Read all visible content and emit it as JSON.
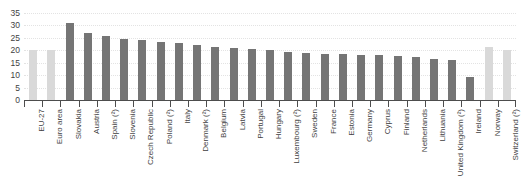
{
  "chart_data": {
    "type": "bar",
    "title": "",
    "xlabel": "",
    "ylabel": "",
    "ylim": [
      0,
      35
    ],
    "ytick_step": 5,
    "yticks": [
      "0",
      "5",
      "10",
      "15",
      "20",
      "25",
      "30",
      "35"
    ],
    "grid": true,
    "legend": "none",
    "categories": [
      "EU-27",
      "Euro area",
      "Slovakia",
      "Austria",
      "Spain (²)",
      "Slovenia",
      "Czech Republic",
      "Poland (²)",
      "Italy",
      "Denmark (²)",
      "Belgium",
      "Latvia",
      "Portugal",
      "Hungary",
      "Luxembourg (²)",
      "Sweden",
      "France",
      "Estonia",
      "Germany",
      "Cyprus",
      "Finland",
      "Netherlands",
      "Lithuania",
      "United Kingdom (²)",
      "Ireland",
      "Norway",
      "Switzerland (²)"
    ],
    "values": [
      20.0,
      20.0,
      30.8,
      27.0,
      25.6,
      24.7,
      24.1,
      23.3,
      23.0,
      22.1,
      21.5,
      21.0,
      20.4,
      20.2,
      19.3,
      19.1,
      18.6,
      18.4,
      18.2,
      18.0,
      17.6,
      17.4,
      16.4,
      16.2,
      9.2,
      21.3,
      20.3
    ],
    "series_colors": {
      "aggregate": "#d9d9d9",
      "country": "#757575"
    },
    "bar_styles": [
      "light",
      "light",
      "dark",
      "dark",
      "dark",
      "dark",
      "dark",
      "dark",
      "dark",
      "dark",
      "dark",
      "dark",
      "dark",
      "dark",
      "dark",
      "dark",
      "dark",
      "dark",
      "dark",
      "dark",
      "dark",
      "dark",
      "dark",
      "dark",
      "dark",
      "light",
      "light"
    ]
  }
}
